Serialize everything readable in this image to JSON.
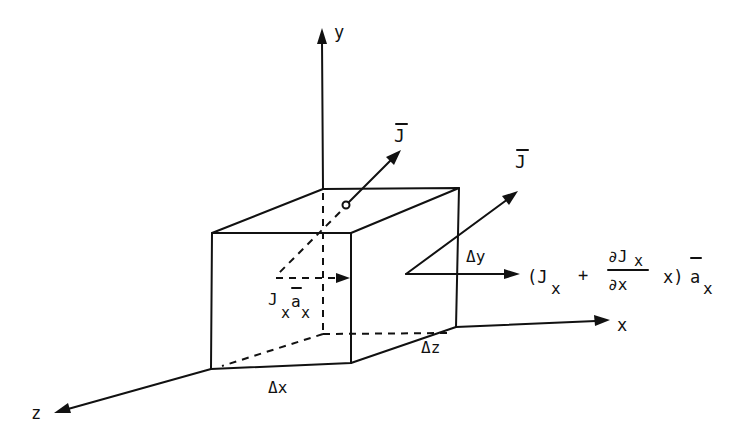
{
  "diagram": {
    "axes": {
      "x_label": "x",
      "y_label": "y",
      "z_label": "z"
    },
    "vectors": {
      "top_vector_label": "J",
      "right_vector_label": "J"
    },
    "dimensions": {
      "dx": "Δx",
      "dy": "Δy",
      "dz": "Δz"
    },
    "entering_flux": {
      "J": "J",
      "sub1": "x",
      "a": "a",
      "sub2": "x"
    },
    "exiting_flux": {
      "open_paren": "(J",
      "sub_jx": "x",
      "plus": "+",
      "numerator": "∂J",
      "numerator_sub": "x",
      "denominator": "∂x",
      "tail": "x)",
      "unit": "a",
      "unit_sub": "x"
    },
    "colors": {
      "ink": "#111111",
      "background": "#ffffff"
    }
  }
}
